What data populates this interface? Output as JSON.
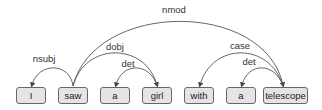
{
  "diagram": {
    "type": "dependency-parse",
    "words": [
      {
        "text": "I",
        "x": 16,
        "w": 30
      },
      {
        "text": "saw",
        "x": 58,
        "w": 30
      },
      {
        "text": "a",
        "x": 100,
        "w": 30
      },
      {
        "text": "girl",
        "x": 142,
        "w": 30
      },
      {
        "text": "with",
        "x": 184,
        "w": 30
      },
      {
        "text": "a",
        "x": 226,
        "w": 30
      },
      {
        "text": "telescope",
        "x": 263,
        "w": 45
      }
    ],
    "arcs": [
      {
        "label": "nsubj",
        "head": "saw",
        "dependent": "I"
      },
      {
        "label": "dobj",
        "head": "saw",
        "dependent": "girl"
      },
      {
        "label": "det",
        "head": "girl",
        "dependent": "a"
      },
      {
        "label": "nmod",
        "head": "saw",
        "dependent": "telescope"
      },
      {
        "label": "case",
        "head": "telescope",
        "dependent": "with"
      },
      {
        "label": "det",
        "head": "telescope",
        "dependent": "a"
      }
    ],
    "colors": {
      "box_fill": "#e4e4e4",
      "box_border": "#666666",
      "arc": "#555555"
    }
  }
}
